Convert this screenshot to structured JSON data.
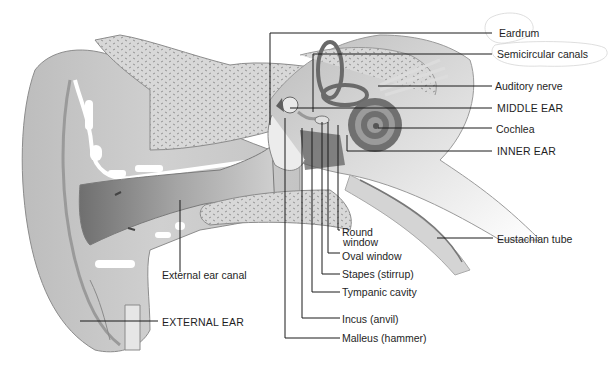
{
  "diagram": {
    "colors": {
      "background": "#ffffff",
      "tissue": "#c9c9c9",
      "tissue_dark": "#8a8a8a",
      "bone": "#d6d6d6",
      "leader_line": "#1a1a1a",
      "text": "#1e1e1e"
    },
    "labels": {
      "eardrum": "Eardrum",
      "semicircular_canals": "Semicircular canals",
      "auditory_nerve": "Auditory nerve",
      "middle_ear": "MIDDLE EAR",
      "cochlea": "Cochlea",
      "inner_ear": "INNER EAR",
      "eustachian_tube": "Eustachian tube",
      "round_window_1": "Round",
      "round_window_2": "window",
      "oval_window": "Oval window",
      "stapes": "Stapes (stirrup)",
      "tympanic_cavity": "Tympanic cavity",
      "incus": "Incus (anvil)",
      "malleus": "Malleus (hammer)",
      "external_ear_canal": "External ear canal",
      "external_ear": "EXTERNAL EAR"
    }
  }
}
